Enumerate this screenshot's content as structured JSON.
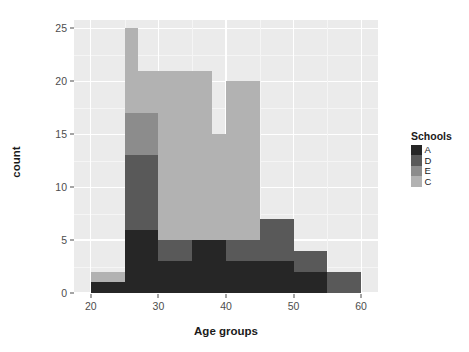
{
  "chart_data": {
    "type": "bar",
    "subtype": "stacked-histogram",
    "title": "",
    "xlabel": "Age groups",
    "ylabel": "count",
    "xlim": [
      17.5,
      62.5
    ],
    "ylim": [
      0,
      25.8
    ],
    "xticks": [
      20,
      30,
      40,
      50,
      60
    ],
    "yticks": [
      0,
      5,
      10,
      15,
      20,
      25
    ],
    "grid": true,
    "legend": {
      "title": "Schools",
      "position": "right",
      "entries": [
        {
          "label": "A",
          "color": "#262626"
        },
        {
          "label": "D",
          "color": "#595959"
        },
        {
          "label": "E",
          "color": "#8c8c8c"
        },
        {
          "label": "C",
          "color": "#b2b2b2"
        }
      ]
    },
    "series_order": [
      "A",
      "D",
      "E",
      "C"
    ],
    "bins": [
      {
        "x0": 20,
        "x1": 25,
        "A": 1,
        "D": 0,
        "E": 0,
        "C": 1,
        "total": 2
      },
      {
        "x0": 25,
        "x1": 27,
        "A": 6,
        "D": 7,
        "E": 4,
        "C": 8,
        "total": 25
      },
      {
        "x0": 27,
        "x1": 30,
        "A": 6,
        "D": 7,
        "E": 4,
        "C": 4,
        "total": 21
      },
      {
        "x0": 30,
        "x1": 35,
        "A": 3,
        "D": 2,
        "E": 0,
        "C": 16,
        "total": 21
      },
      {
        "x0": 35,
        "x1": 38,
        "A": 5,
        "D": 0,
        "E": 0,
        "C": 16,
        "total": 21
      },
      {
        "x0": 38,
        "x1": 40,
        "A": 5,
        "D": 0,
        "E": 0,
        "C": 10,
        "total": 15
      },
      {
        "x0": 40,
        "x1": 45,
        "A": 3,
        "D": 2,
        "E": 0,
        "C": 15,
        "total": 20
      },
      {
        "x0": 45,
        "x1": 48,
        "A": 3,
        "D": 4,
        "E": 0,
        "C": 0,
        "total": 7
      },
      {
        "x0": 48,
        "x1": 50,
        "A": 3,
        "D": 4,
        "E": 0,
        "C": 0,
        "total": 7
      },
      {
        "x0": 50,
        "x1": 55,
        "A": 2,
        "D": 2,
        "E": 0,
        "C": 0,
        "total": 4
      },
      {
        "x0": 55,
        "x1": 60,
        "A": 0,
        "D": 2,
        "E": 0,
        "C": 0,
        "total": 2
      }
    ],
    "colors": {
      "panel_background": "#ebebeb",
      "grid_major": "#ffffff",
      "grid_minor": "#f5f5f5",
      "plot_background": "#ffffff",
      "axis_text": "#4d4d4d",
      "title_text": "#1a1a1a"
    }
  }
}
